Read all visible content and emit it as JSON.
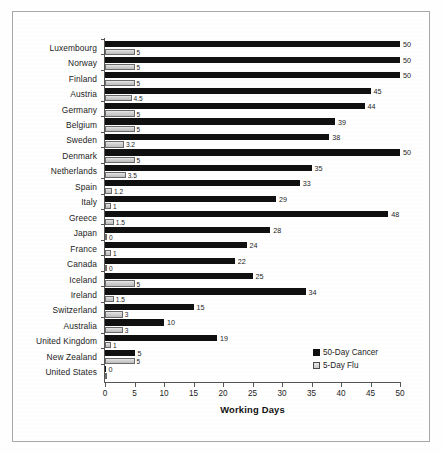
{
  "chart_data": {
    "type": "bar",
    "orientation": "horizontal",
    "title": "",
    "xlabel": "Working Days",
    "ylabel": "",
    "xlim": [
      0,
      50
    ],
    "xticks": [
      0,
      5,
      10,
      15,
      20,
      25,
      30,
      35,
      40,
      45,
      50
    ],
    "grid": false,
    "legend_position": "inside-bottom-right",
    "categories": [
      "Luxembourg",
      "Norway",
      "Finland",
      "Austria",
      "Germany",
      "Belgium",
      "Sweden",
      "Denmark",
      "Netherlands",
      "Spain",
      "Italy",
      "Greece",
      "Japan",
      "France",
      "Canada",
      "Iceland",
      "Ireland",
      "Switzerland",
      "Australia",
      "United Kingdom",
      "New Zealand",
      "United States"
    ],
    "series": [
      {
        "name": "50-Day Cancer",
        "color": "#101010",
        "values": [
          50,
          50,
          50,
          45,
          44,
          39,
          38,
          50,
          35,
          33,
          29,
          48,
          28,
          24,
          22,
          25,
          34,
          15,
          10,
          19,
          5,
          0
        ],
        "labels": [
          "50",
          "50",
          "50",
          "45",
          "44",
          "39",
          "38",
          "50",
          "35",
          "33",
          "29",
          "48",
          "28",
          "24",
          "22",
          "25",
          "34",
          "15",
          "10",
          "19",
          "5",
          "0"
        ]
      },
      {
        "name": "5-Day Flu",
        "color": "#d2d2d2",
        "values": [
          5,
          5,
          5,
          4.5,
          5,
          5,
          3.2,
          5,
          3.5,
          1.2,
          1,
          1.5,
          0,
          1,
          0,
          5,
          1.5,
          3,
          3,
          1,
          5,
          0
        ],
        "labels": [
          "5",
          "5",
          "5",
          "4.5",
          "5",
          "5",
          "3.2",
          "5",
          "3.5",
          "1.2",
          "1",
          "1.5",
          "0",
          "1",
          "0",
          "5",
          "1.5",
          "3",
          "3",
          "1",
          "5",
          ""
        ]
      }
    ]
  },
  "legend": {
    "items": [
      {
        "label": "50-Day Cancer",
        "swatch": "filled-black-square"
      },
      {
        "label": "5-Day Flu",
        "swatch": "hatched-light-square"
      }
    ]
  },
  "axis": {
    "x_title": "Working Days"
  }
}
